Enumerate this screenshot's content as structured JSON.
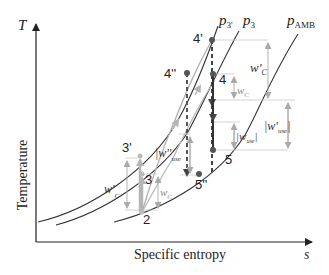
{
  "axes": {
    "y_symbol": "T",
    "y_label": "Temperature",
    "x_symbol": "s",
    "x_label": "Specific entropy"
  },
  "isobars": {
    "p3prime": {
      "label": "p",
      "sub": "3'"
    },
    "p3": {
      "label": "p",
      "sub": "3"
    },
    "pamb": {
      "label": "p",
      "sub": "AMB"
    }
  },
  "points": {
    "p2": "2",
    "p3": "3",
    "p3prime": "3'",
    "p4": "4",
    "p4prime": "4'",
    "p4dprime": "4''",
    "p5": "5",
    "p5dprime": "5''"
  },
  "work_labels": {
    "wc_main": {
      "w": "w",
      "sub": "C"
    },
    "wc_prime_main": {
      "w": "w'",
      "sub": "C"
    },
    "wc_low": {
      "w": "w",
      "sub": "C"
    },
    "wc_prime_low": {
      "w": "w'",
      "sub": "C"
    },
    "wuse": {
      "w": "|w",
      "sub": "use",
      "close": "|"
    },
    "wuse_prime": {
      "w": "|w'",
      "sub": "use",
      "close": "|"
    },
    "wuse_dprime": {
      "w": "|w''",
      "sub": "use",
      "close": ""
    }
  },
  "colors": {
    "axis": "#222222",
    "curve": "#333333",
    "grey_curve": "#9a9a9a",
    "guide": "#bfbfbf",
    "marker": "#555555"
  }
}
